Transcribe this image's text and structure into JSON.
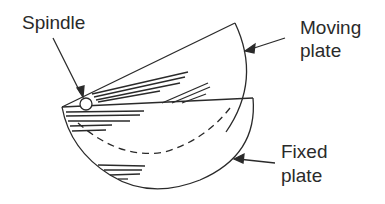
{
  "diagram": {
    "labels": {
      "spindle": "Spindle",
      "moving_plate_line1": "Moving",
      "moving_plate_line2": "plate",
      "fixed_plate_line1": "Fixed",
      "fixed_plate_line2": "plate"
    },
    "colors": {
      "stroke": "#2a2a2a",
      "background": "#ffffff"
    }
  }
}
